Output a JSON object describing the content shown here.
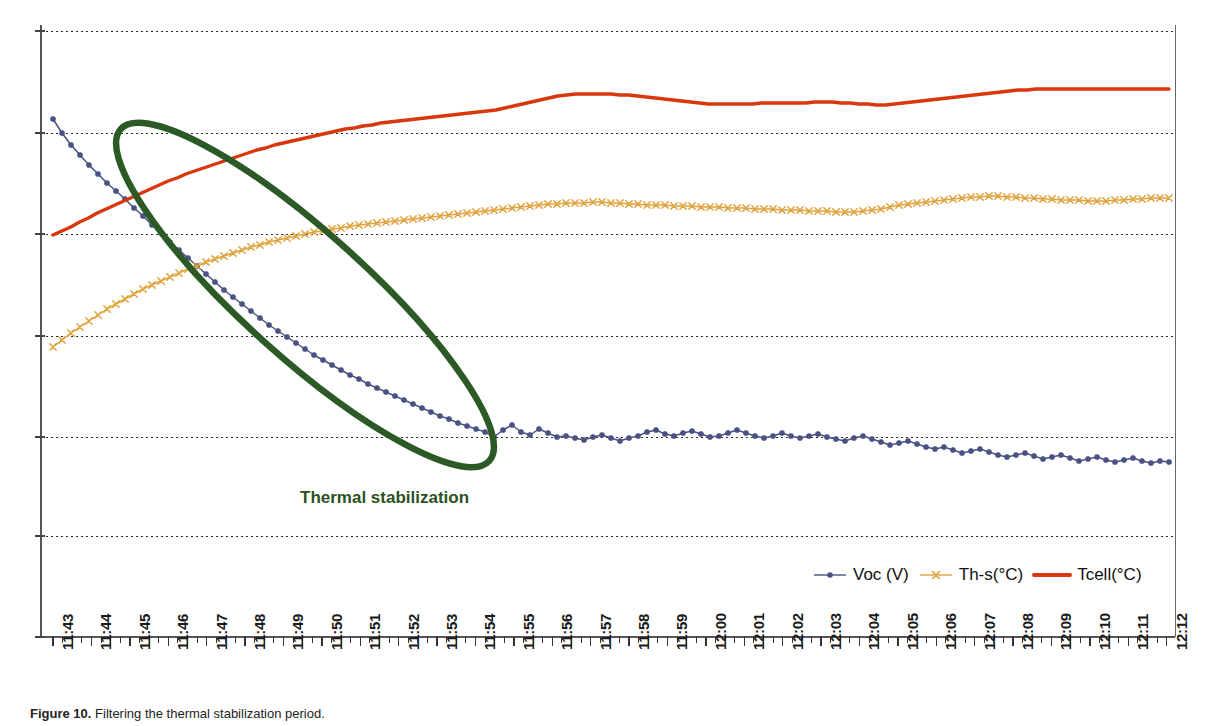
{
  "figure": {
    "caption_label": "Figure 10.",
    "caption_text": "Filtering the thermal stabilization period.",
    "background_color": "#ffffff"
  },
  "annotation": {
    "text": "Thermal stabilization",
    "color": "#2b5220",
    "ellipse_color": "#2c5a26"
  },
  "legend": {
    "position": "bottom-right",
    "items": [
      {
        "label": "Voc (V)",
        "color": "#4a5284",
        "marker": "dot-marker-icon"
      },
      {
        "label": "Th-s(°C)",
        "color": "#e0a33c",
        "marker": "cross-marker-icon"
      },
      {
        "label": "Tcell(°C)",
        "color": "#d9370d",
        "marker": "line-marker-icon"
      }
    ]
  },
  "chart_data": {
    "type": "line",
    "title": "",
    "xlabel": "",
    "ylabel": "",
    "grid": true,
    "legend_position": "bottom-right",
    "axis": {
      "x_range": [
        "11:43",
        "12:12"
      ],
      "y_gridline_count": 7,
      "y_tick_labels": [],
      "x_minor_ticks_per_minute": 3
    },
    "x_tick_labels": [
      "11:43",
      "11:44",
      "11:45",
      "11:46",
      "11:47",
      "11:48",
      "11:49",
      "11:50",
      "11:51",
      "11:52",
      "11:53",
      "11:54",
      "11:55",
      "11:56",
      "11:57",
      "11:58",
      "11:59",
      "12:00",
      "12:01",
      "12:02",
      "12:03",
      "12:04",
      "12:05",
      "12:06",
      "12:07",
      "12:08",
      "12:09",
      "12:10",
      "12:11",
      "12:12"
    ],
    "series": [
      {
        "name": "Voc (V)",
        "color": "#4a5284",
        "marker": "dot",
        "values": [
          119,
          133,
          145,
          155,
          165,
          174,
          183,
          191,
          199,
          208,
          216,
          225,
          233,
          242,
          250,
          258,
          266,
          274,
          282,
          290,
          297,
          304,
          311,
          318,
          325,
          331,
          337,
          343,
          349,
          355,
          360,
          365,
          370,
          375,
          379,
          384,
          388,
          392,
          396,
          400,
          404,
          408,
          412,
          416,
          419,
          423,
          426,
          429,
          432,
          437,
          430,
          425,
          432,
          435,
          429,
          433,
          437,
          436,
          438,
          440,
          437,
          435,
          438,
          441,
          438,
          436,
          432,
          430,
          434,
          436,
          433,
          431,
          434,
          437,
          436,
          433,
          430,
          433,
          436,
          438,
          436,
          433,
          436,
          438,
          436,
          434,
          437,
          439,
          441,
          438,
          436,
          439,
          442,
          445,
          443,
          441,
          444,
          447,
          449,
          447,
          450,
          453,
          451,
          449,
          452,
          455,
          457,
          455,
          453,
          456,
          459,
          457,
          455,
          458,
          461,
          459,
          457,
          460,
          462,
          460,
          458,
          461,
          463,
          461,
          462
        ]
      },
      {
        "name": "Th-s(°C)",
        "color": "#e0a33c",
        "marker": "cross",
        "values": [
          347,
          340,
          333,
          327,
          321,
          315,
          309,
          304,
          299,
          294,
          289,
          285,
          281,
          277,
          273,
          269,
          266,
          262,
          259,
          256,
          253,
          250,
          247,
          245,
          242,
          240,
          238,
          236,
          234,
          232,
          231,
          229,
          228,
          226,
          225,
          224,
          223,
          222,
          221,
          220,
          219,
          218,
          217,
          216,
          215,
          214,
          213,
          212,
          211,
          210,
          209,
          208,
          207,
          206,
          205,
          204,
          204,
          203,
          203,
          203,
          202,
          202,
          203,
          203,
          204,
          204,
          205,
          205,
          205,
          206,
          206,
          206,
          207,
          207,
          207,
          208,
          208,
          208,
          209,
          209,
          209,
          210,
          210,
          210,
          211,
          211,
          211,
          212,
          212,
          212,
          211,
          210,
          209,
          207,
          205,
          204,
          203,
          202,
          201,
          200,
          199,
          198,
          197,
          197,
          196,
          196,
          197,
          197,
          198,
          198,
          199,
          199,
          200,
          200,
          200,
          201,
          201,
          201,
          200,
          200,
          199,
          199,
          198,
          198,
          198
        ]
      },
      {
        "name": "Tcell(°C)",
        "color": "#d9370d",
        "marker": "none",
        "values": [
          235,
          231,
          227,
          222,
          218,
          213,
          209,
          205,
          201,
          197,
          193,
          189,
          185,
          181,
          178,
          174,
          171,
          168,
          165,
          162,
          159,
          156,
          153,
          150,
          148,
          145,
          143,
          141,
          139,
          137,
          135,
          133,
          131,
          129,
          128,
          126,
          125,
          123,
          122,
          121,
          120,
          119,
          118,
          117,
          116,
          115,
          114,
          113,
          112,
          111,
          110,
          108,
          106,
          104,
          102,
          100,
          98,
          96,
          95,
          94,
          94,
          94,
          94,
          94,
          95,
          95,
          96,
          97,
          98,
          99,
          100,
          101,
          102,
          103,
          104,
          104,
          104,
          104,
          104,
          104,
          103,
          103,
          103,
          103,
          103,
          103,
          102,
          102,
          102,
          103,
          103,
          104,
          104,
          105,
          105,
          104,
          103,
          102,
          101,
          100,
          99,
          98,
          97,
          96,
          95,
          94,
          93,
          92,
          91,
          90,
          90,
          89,
          89,
          89,
          89,
          89,
          89,
          89,
          89,
          89,
          89,
          89,
          89,
          89,
          89,
          89,
          89
        ]
      }
    ]
  },
  "plot_geometry": {
    "left": 41,
    "right": 1175,
    "top": 31,
    "bottom": 637,
    "first_tick_x": 53,
    "minute_spacing": 38.4,
    "gridlines_y": [
      31,
      133,
      234,
      336,
      437,
      536,
      637
    ]
  }
}
